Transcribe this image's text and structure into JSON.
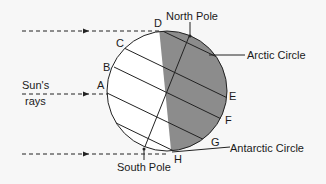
{
  "diagram": {
    "labels": {
      "north_pole": "North Pole",
      "south_pole": "South Pole",
      "arctic_circle": "Arctic Circle",
      "antarctic_circle": "Antarctic Circle",
      "suns_rays_line1": "Sun's",
      "suns_rays_line2": "rays"
    },
    "points": {
      "A": "A",
      "B": "B",
      "C": "C",
      "D": "D",
      "E": "E",
      "F": "F",
      "G": "G",
      "H": "H"
    },
    "colors": {
      "background": "#f7f7f7",
      "night_shade": "#8c8c8c",
      "line": "#222222"
    }
  }
}
